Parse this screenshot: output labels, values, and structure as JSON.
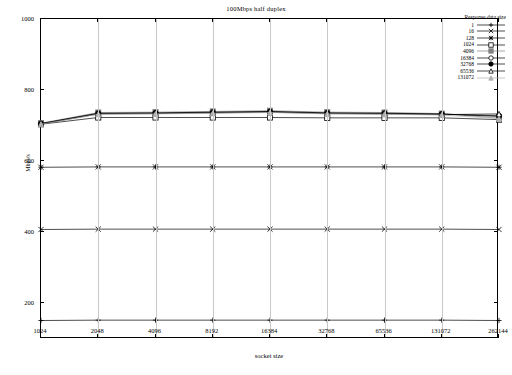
{
  "chart_data": {
    "type": "line",
    "title": "100Mbps half duplex",
    "xlabel": "socket size",
    "ylabel": "Mbps/s",
    "grid": "vertical",
    "legend_position": "top-right",
    "legend_title": "Response data size",
    "x": [
      "1024",
      "2048",
      "4096",
      "8192",
      "16384",
      "32768",
      "65536",
      "131072",
      "262144"
    ],
    "xtick_labels": [
      "1024",
      "2048",
      "4096",
      "8192",
      "16384",
      "32768",
      "65536",
      "131072",
      "262144"
    ],
    "ytick_labels": [
      "200",
      "400",
      "600",
      "800",
      "1000"
    ],
    "ylim": [
      100,
      1000
    ],
    "yticks": [
      200,
      400,
      600,
      800,
      1000
    ],
    "series": [
      {
        "name": "1",
        "marker": "plus",
        "color": "#000000",
        "values": [
          152,
          153,
          153,
          153,
          153,
          153,
          153,
          153,
          152
        ]
      },
      {
        "name": "16",
        "marker": "cross",
        "color": "#000000",
        "values": [
          408,
          409,
          409,
          409,
          409,
          409,
          409,
          409,
          408
        ]
      },
      {
        "name": "128",
        "marker": "star",
        "color": "#000000",
        "values": [
          583,
          584,
          584,
          584,
          584,
          584,
          584,
          584,
          583
        ]
      },
      {
        "name": "1024",
        "marker": "square",
        "color": "#000000",
        "values": [
          704,
          723,
          723,
          723,
          723,
          722,
          722,
          722,
          717
        ]
      },
      {
        "name": "4096",
        "marker": "filled-square",
        "color": "#808080",
        "values": [
          707,
          737,
          738,
          740,
          742,
          738,
          737,
          734,
          721
        ]
      },
      {
        "name": "16384",
        "marker": "circle",
        "color": "#000000",
        "values": [
          706,
          735,
          736,
          738,
          740,
          736,
          735,
          733,
          726
        ]
      },
      {
        "name": "32768",
        "marker": "filled-circle",
        "color": "#000000",
        "values": [
          705,
          734,
          735,
          737,
          739,
          735,
          734,
          732,
          728
        ]
      },
      {
        "name": "65536",
        "marker": "triangle",
        "color": "#000000",
        "values": [
          705,
          733,
          734,
          736,
          738,
          734,
          733,
          731,
          733
        ]
      },
      {
        "name": "131072",
        "marker": "filled-triangle",
        "color": "#b0b0b0",
        "values": [
          704,
          732,
          733,
          735,
          737,
          733,
          732,
          730,
          720
        ]
      }
    ]
  }
}
